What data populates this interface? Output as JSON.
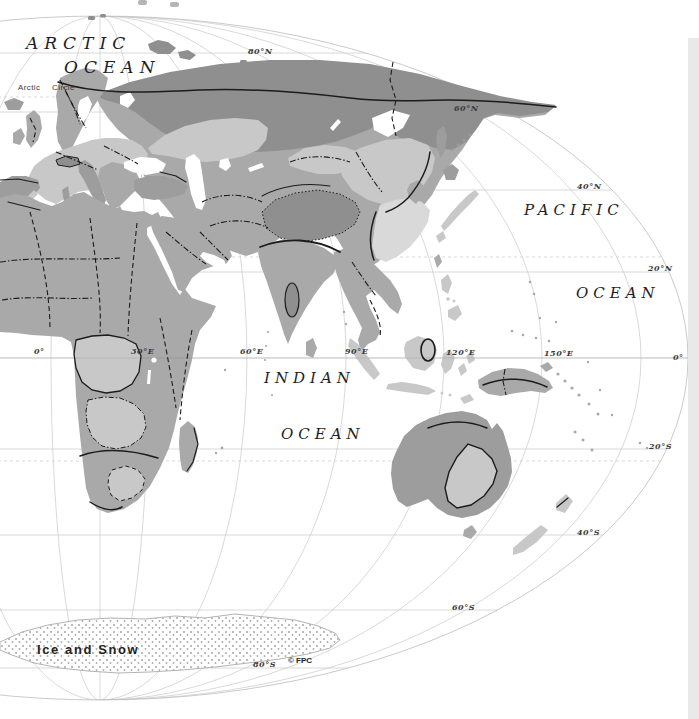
{
  "map": {
    "oceans": {
      "arctic": [
        "ARCTIC",
        "OCEAN"
      ],
      "pacific": [
        "PACIFIC",
        "OCEAN"
      ],
      "indian": [
        "INDIAN",
        "OCEAN"
      ]
    },
    "annotations": {
      "arctic_circle": "Arctic Circle",
      "ice_and_snow": "Ice and Snow",
      "credit": "© FPC"
    },
    "latitude_labels": [
      "80°N",
      "60°N",
      "40°N",
      "20°N",
      "0°",
      "20°S",
      "40°S",
      "60°S",
      "80°S"
    ],
    "longitude_labels": [
      "0°",
      "30°E",
      "60°E",
      "90°E",
      "120°E",
      "150°E"
    ],
    "colors": {
      "ocean": "#ffffff",
      "land_dark": "#8f8f8f",
      "land_mdark": "#9d9d9d",
      "land_medium": "#a9a9a9",
      "land_light": "#c8c8c8",
      "land_xlight": "#d9d9d9",
      "boundary": "#1c1c1c",
      "graticule": "#c8c8c8",
      "ice_outline": "#b3b3b3",
      "edge_strip": "#e9e9e9",
      "label": "#2b2b2b"
    }
  }
}
